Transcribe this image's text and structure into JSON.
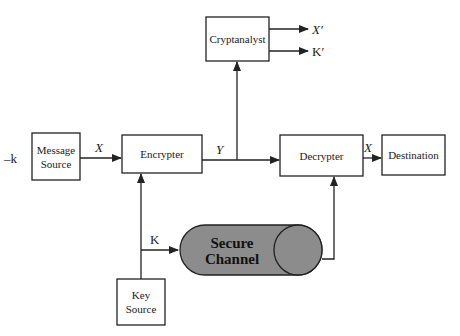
{
  "diagram": {
    "type": "block-diagram",
    "left_label": "–k",
    "nodes": {
      "message_source": {
        "line1": "Message",
        "line2": "Source"
      },
      "encrypter": {
        "label": "Encrypter"
      },
      "decrypter": {
        "label": "Decrypter"
      },
      "destination": {
        "label": "Destination"
      },
      "cryptanalyst": {
        "label": "Cryptanalyst"
      },
      "key_source": {
        "line1": "Key",
        "line2": "Source"
      },
      "secure_channel": {
        "line1": "Secure",
        "line2": "Channel"
      }
    },
    "edges": {
      "source_to_encrypter": "X",
      "encrypter_to_decrypter": "Y",
      "decrypter_to_destination": "X",
      "key_to_channel": "K",
      "cryptanalyst_out_1": "X′",
      "cryptanalyst_out_2": "K′"
    },
    "connections": [
      {
        "from": "message_source",
        "to": "encrypter",
        "label": "X"
      },
      {
        "from": "encrypter",
        "to": "decrypter",
        "label": "Y"
      },
      {
        "from": "encrypter",
        "to": "cryptanalyst",
        "label": "Y"
      },
      {
        "from": "decrypter",
        "to": "destination",
        "label": "X"
      },
      {
        "from": "key_source",
        "to": "encrypter",
        "label": ""
      },
      {
        "from": "key_source",
        "to": "secure_channel",
        "label": "K"
      },
      {
        "from": "secure_channel",
        "to": "decrypter",
        "label": ""
      },
      {
        "from": "cryptanalyst",
        "to": "output",
        "label": "X′"
      },
      {
        "from": "cryptanalyst",
        "to": "output",
        "label": "K′"
      }
    ]
  }
}
